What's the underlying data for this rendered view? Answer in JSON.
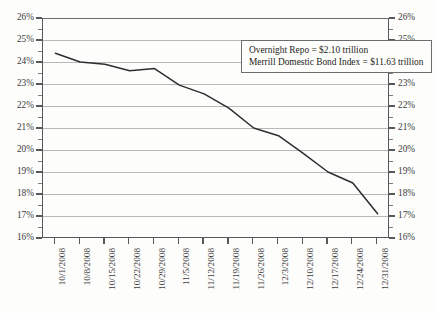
{
  "chart_data": {
    "type": "line",
    "title": "",
    "subtitle": "",
    "xlabel": "",
    "ylabel": "",
    "ylim": [
      16,
      26
    ],
    "ytick_step": 1,
    "grid": true,
    "legend_position": "none",
    "y_axis_left_labels": [
      "26%",
      "25%",
      "24%",
      "23%",
      "22%",
      "21%",
      "20%",
      "19%",
      "18%",
      "17%",
      "16%"
    ],
    "y_axis_right_labels": [
      "26%",
      "25%",
      "24%",
      "23%",
      "22%",
      "21%",
      "20%",
      "19%",
      "18%",
      "17%",
      "16%"
    ],
    "y_tick_values": [
      26,
      25,
      24,
      23,
      22,
      21,
      20,
      19,
      18,
      17,
      16
    ],
    "categories": [
      "10/1/2008",
      "10/8/2008",
      "10/15/2008",
      "10/22/2008",
      "10/29/2008",
      "11/5/2008",
      "11/12/2008",
      "11/19/2008",
      "11/26/2008",
      "12/3/2008",
      "12/10/2008",
      "12/17/2008",
      "12/24/2008",
      "12/31/2008"
    ],
    "series": [
      {
        "name": "Overnight Repo as % of Merrill Domestic Bond Index",
        "values": [
          24.4,
          24.0,
          23.9,
          23.6,
          23.7,
          22.95,
          22.55,
          21.9,
          21.0,
          20.65,
          19.85,
          19.0,
          18.5,
          17.1
        ]
      }
    ],
    "annotations": [
      "Overnight Repo  =  $2.10 trillion",
      "Merrill Domestic Bond Index  =  $11.63 trillion"
    ],
    "colors": {
      "line": "#2e2e30",
      "gridline": "#b8b8b8",
      "axis": "#58585a",
      "background": "#fdfdfb",
      "text": "#3b3b3d"
    }
  },
  "annotation_box": {
    "line1": "Overnight Repo  =  $2.10 trillion",
    "line2": "Merrill Domestic Bond Index  =  $11.63 trillion"
  }
}
